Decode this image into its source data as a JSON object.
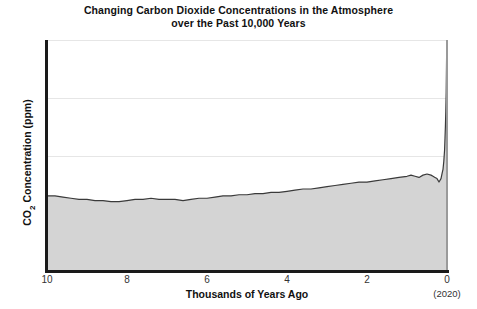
{
  "chart_data": {
    "type": "area",
    "title": "Changing Carbon Dioxide Concentrations in the Atmosphere over the Past 10,000 Years",
    "title_line1": "Changing Carbon Dioxide Concentrations in the Atmosphere",
    "title_line2": "over the Past 10,000 Years",
    "xlabel": "Thousands of Years Ago",
    "xlabel_sub": "(2020)",
    "ylabel": "CO₂ Concentration (ppm)",
    "ylabel_main": "CO",
    "ylabel_sub": "2",
    "ylabel_rest": " Concentration (ppm)",
    "xlim": [
      10,
      0
    ],
    "ylim": [
      200,
      400
    ],
    "x_ticks": [
      10,
      8,
      6,
      4,
      2,
      0
    ],
    "x_tick_labels": [
      "10",
      "8",
      "6",
      "4",
      "2",
      "0"
    ],
    "y_ticks": [
      200,
      250,
      300,
      350,
      400
    ],
    "y_tick_labels": [
      "200",
      "250",
      "300",
      "350",
      "400"
    ],
    "grid": true,
    "legend": "none",
    "x_axis_direction": "reversed",
    "fill_color": "#d4d4d4",
    "line_color": "#3a3a3a",
    "grid_color": "#e6e6e6",
    "axis_color": "#1a1a1a",
    "background": "#ffffff",
    "series_name": "Atmospheric CO2 concentration",
    "x": [
      10.0,
      9.8,
      9.6,
      9.4,
      9.2,
      9.0,
      8.8,
      8.6,
      8.4,
      8.2,
      8.0,
      7.8,
      7.6,
      7.4,
      7.2,
      7.0,
      6.8,
      6.6,
      6.4,
      6.2,
      6.0,
      5.8,
      5.6,
      5.4,
      5.2,
      5.0,
      4.8,
      4.6,
      4.4,
      4.2,
      4.0,
      3.8,
      3.6,
      3.4,
      3.2,
      3.0,
      2.8,
      2.6,
      2.4,
      2.2,
      2.0,
      1.8,
      1.6,
      1.4,
      1.2,
      1.0,
      0.9,
      0.8,
      0.7,
      0.6,
      0.5,
      0.4,
      0.35,
      0.3,
      0.25,
      0.2,
      0.15,
      0.12,
      0.1,
      0.08,
      0.06,
      0.05,
      0.04,
      0.03,
      0.02,
      0.01,
      0.0
    ],
    "values": [
      265,
      265,
      264,
      263,
      262,
      262,
      261,
      261,
      260,
      260,
      261,
      262,
      262,
      263,
      262,
      262,
      262,
      261,
      262,
      263,
      263,
      264,
      265,
      265,
      266,
      266,
      267,
      267,
      268,
      268,
      269,
      270,
      271,
      271,
      272,
      273,
      274,
      275,
      276,
      277,
      277,
      278,
      279,
      280,
      281,
      282,
      283,
      282,
      281,
      283,
      284,
      283,
      282,
      281,
      280,
      277,
      280,
      285,
      288,
      295,
      305,
      315,
      325,
      338,
      355,
      385,
      415
    ],
    "annotations": [
      {
        "text": "Sharp rise in CO2 concentration at the present day (2020) to approximately 415 ppm",
        "x": 0,
        "y": 415
      }
    ]
  }
}
